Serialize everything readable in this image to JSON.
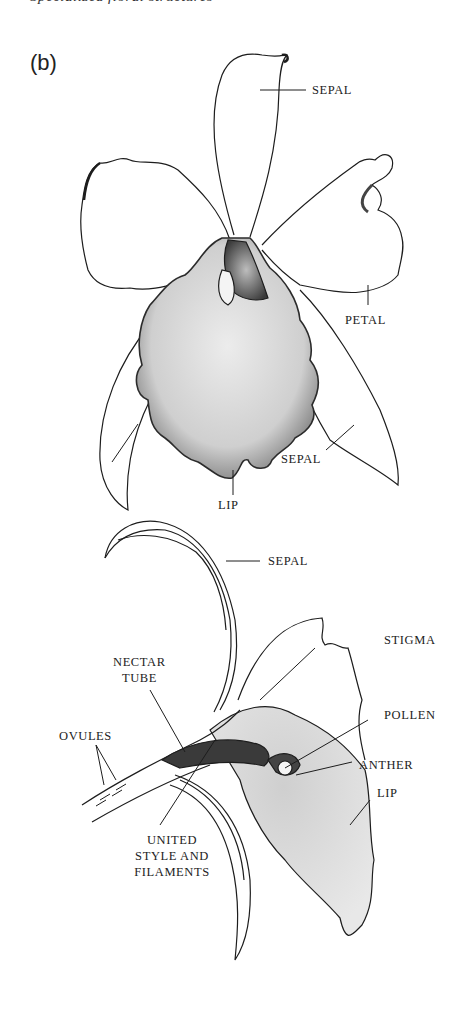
{
  "figure": {
    "clipped_caption": "Specialized floral structures",
    "panel_label": "(b)",
    "front_view": {
      "labels": {
        "sepal_top": "SEPAL",
        "petal": "PETAL",
        "sepal_right": "SEPAL",
        "lip": "LIP"
      }
    },
    "side_view": {
      "labels": {
        "sepal": "SEPAL",
        "stigma": "STIGMA",
        "nectar_tube_1": "NECTAR",
        "nectar_tube_2": "TUBE",
        "pollen": "POLLEN",
        "ovules": "OVULES",
        "anther": "ANTHER",
        "lip": "LIP",
        "united_1": "UNITED",
        "united_2": "STYLE AND",
        "united_3": "FILAMENTS"
      }
    },
    "colors": {
      "ink": "#1d1d1d",
      "stipple": "#9a9a9a",
      "lip_fill": "#d9d9d9",
      "background": "#ffffff"
    }
  }
}
